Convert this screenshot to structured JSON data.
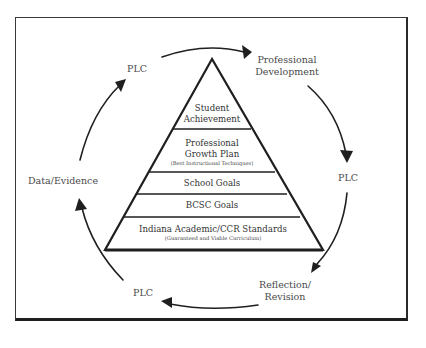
{
  "diagram": {
    "type": "cycle-around-pyramid",
    "pyramid": {
      "tiers": [
        {
          "lines": [
            "Student",
            "Achievement"
          ],
          "sub": ""
        },
        {
          "lines": [
            "Professional",
            "Growth Plan"
          ],
          "sub": "(Best Instructional Techniques)"
        },
        {
          "lines": [
            "School Goals"
          ],
          "sub": ""
        },
        {
          "lines": [
            "BCSC Goals"
          ],
          "sub": ""
        },
        {
          "lines": [
            "Indiana Academic/CCR Standards"
          ],
          "sub": "(Guaranteed and Viable Curriculum)"
        }
      ]
    },
    "cycle": {
      "nodes": [
        {
          "id": "plc_top",
          "lines": [
            "PLC"
          ]
        },
        {
          "id": "pd",
          "lines": [
            "Professional",
            "Development"
          ]
        },
        {
          "id": "plc_right",
          "lines": [
            "PLC"
          ]
        },
        {
          "id": "reflection",
          "lines": [
            "Reflection/",
            "Revision"
          ]
        },
        {
          "id": "plc_bottom",
          "lines": [
            "PLC"
          ]
        },
        {
          "id": "data",
          "lines": [
            "Data/Evidence"
          ]
        }
      ],
      "direction": "clockwise"
    },
    "colors": {
      "line": "#1f1f1f",
      "text": "#4a4a4a",
      "background": "#ffffff"
    }
  }
}
